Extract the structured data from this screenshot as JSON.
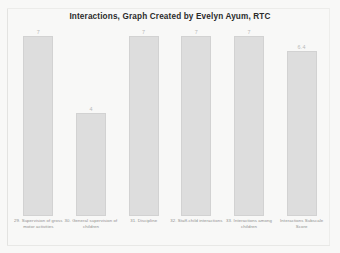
{
  "document": {
    "background_color": "#f8f8f7",
    "border_color": "#e3e3e1"
  },
  "chart_data": {
    "type": "bar",
    "title": "Interactions, Graph Created by Evelyn Ayum, RTC",
    "xlabel": "",
    "ylabel": "",
    "ylim": [
      0,
      7
    ],
    "grid": false,
    "legend": null,
    "bar_color": "#dddddd",
    "categories": [
      "29. Supervision of gross motor activities",
      "30. General supervision of children",
      "31. Discipline",
      "32. Staff-child interactions",
      "33. Interactions among children",
      "Interactions Subscale Score"
    ],
    "values": [
      7,
      4,
      7,
      7,
      7,
      6.4
    ],
    "value_labels": [
      "7",
      "4",
      "7",
      "7",
      "7",
      "6.4"
    ]
  }
}
